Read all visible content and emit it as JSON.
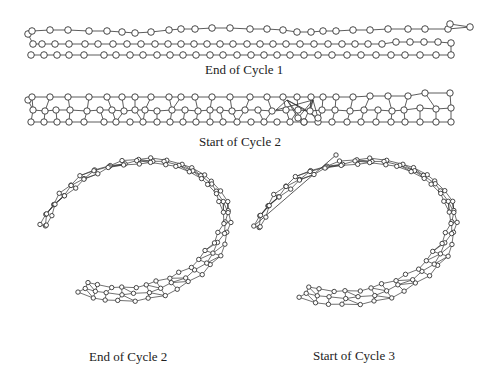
{
  "captions": {
    "panel1": "End of Cycle 1",
    "panel2": "Start of Cycle 2",
    "panel3": "End of Cycle 2",
    "panel4": "Start of Cycle 3"
  },
  "style": {
    "stroke": "#333333",
    "node_fill": "#ffffff",
    "node_stroke": "#333333"
  },
  "strip1": {
    "rows": [
      {
        "y": [
          31,
          30,
          30,
          31,
          31,
          32,
          33,
          32,
          30,
          29,
          29,
          28,
          28,
          29,
          29,
          30,
          32,
          32,
          31,
          31,
          30,
          30,
          29,
          29,
          29,
          29,
          27,
          28,
          24
        ],
        "x": [
          32,
          50,
          68,
          89,
          107,
          122,
          135,
          151,
          169,
          181,
          195,
          212,
          230,
          250,
          267,
          283,
          297,
          311,
          323,
          336,
          353,
          370,
          388,
          408,
          425,
          448,
          470,
          442,
          450
        ]
      },
      {
        "y": [
          44,
          44,
          44,
          44,
          44,
          44,
          44,
          44,
          44,
          44,
          44,
          44,
          45,
          45,
          45,
          45,
          45,
          45,
          45,
          45,
          45,
          45,
          45,
          45,
          44,
          44,
          44,
          44,
          44
        ],
        "x": [
          33,
          42,
          55,
          69,
          85,
          98,
          114,
          128,
          138,
          152,
          161,
          174,
          187,
          200,
          212,
          224,
          236,
          248,
          260,
          271,
          283,
          295,
          307,
          319,
          331,
          343,
          357,
          370,
          385
        ]
      },
      {
        "y": [
          55,
          55,
          55,
          55,
          55,
          55,
          55,
          55,
          55,
          55,
          55,
          55,
          55,
          55,
          55,
          55,
          55,
          55,
          55,
          55,
          55,
          55,
          55,
          55,
          55,
          55,
          55,
          55,
          55,
          55,
          55
        ],
        "x": [
          31,
          44,
          57,
          69,
          84,
          104,
          116,
          130,
          143,
          157,
          170,
          183,
          196,
          210,
          223,
          237,
          251,
          264,
          277,
          290,
          304,
          318,
          332,
          347,
          361,
          376,
          391,
          405,
          420,
          436,
          451
        ]
      }
    ]
  },
  "strip2": {
    "rows_top_y": 97,
    "rows_mid_y": 110,
    "rows_bot_y": 122,
    "top_x": [
      32,
      50,
      68,
      89,
      107,
      122,
      135,
      151,
      169,
      181,
      195,
      212,
      230,
      250,
      267,
      283,
      297,
      311,
      323,
      336,
      353,
      370,
      388,
      408,
      425,
      448,
      450
    ],
    "mid_x": [
      33,
      42,
      55,
      69,
      85,
      98,
      114,
      128,
      138,
      152,
      161,
      174,
      187,
      200,
      212,
      224,
      236,
      248,
      260,
      271,
      283,
      295,
      307,
      319,
      331,
      343,
      357,
      370,
      385,
      398,
      420,
      436,
      451
    ],
    "bot_x": [
      31,
      44,
      57,
      69,
      84,
      104,
      116,
      130,
      143,
      157,
      170,
      183,
      196,
      210,
      223,
      237,
      251,
      264,
      277,
      290,
      304,
      318,
      332,
      347,
      361,
      376,
      391,
      405,
      420,
      436,
      451
    ]
  },
  "ring1": {
    "cx": 135,
    "cy": 230,
    "rx": 96,
    "ry": 70,
    "tilt": -12,
    "start_deg": 200,
    "end_deg": 495,
    "layers": 3,
    "spacing": 6,
    "nodes": 34
  },
  "ring2": {
    "cx": 355,
    "cy": 232,
    "rx": 102,
    "ry": 72,
    "tilt": -10,
    "start_deg": 198,
    "end_deg": 490,
    "layers": 3,
    "spacing": 6,
    "nodes": 34
  }
}
